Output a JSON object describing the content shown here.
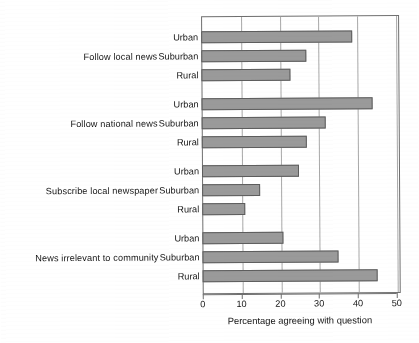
{
  "chart_data": {
    "type": "bar",
    "orientation": "horizontal",
    "title": "",
    "xlabel": "Percentage agreeing with question",
    "ylabel": "",
    "xlim": [
      0,
      50
    ],
    "xticks": [
      0,
      10,
      20,
      30,
      40,
      50
    ],
    "grid": true,
    "legend": "none",
    "bar_color": "#9a9a9a",
    "bar_edge_color": "#5d5d5d",
    "groups": [
      {
        "label": "Follow local news",
        "categories": [
          "Urban",
          "Suburban",
          "Rural"
        ],
        "values": [
          39,
          27,
          23
        ]
      },
      {
        "label": "Follow national news",
        "categories": [
          "Urban",
          "Suburban",
          "Rural"
        ],
        "values": [
          44,
          32,
          27
        ]
      },
      {
        "label": "Subscribe local newspaper",
        "categories": [
          "Urban",
          "Suburban",
          "Rural"
        ],
        "values": [
          25,
          15,
          11
        ]
      },
      {
        "label": "News irrelevant to community",
        "categories": [
          "Urban",
          "Suburban",
          "Rural"
        ],
        "values": [
          21,
          35,
          45
        ]
      }
    ]
  }
}
